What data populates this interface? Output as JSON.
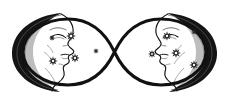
{
  "artwork": {
    "title": "Infinity symbol with crescent moon faces and stars",
    "subject": "double moon infinity tattoo design",
    "style": "black-and-white line art",
    "background_color": "#ffffff",
    "ink_color": "#111111",
    "shading_color": "#5a5a5a",
    "canvas": {
      "width": 229,
      "height": 106
    }
  },
  "composition": {
    "symbol": {
      "name": "infinity-symbol",
      "stroke_color": "#111111",
      "stroke_width": 3.2,
      "crossing_point": {
        "x": 114.5,
        "y": 52
      },
      "left_loop_center": {
        "x": 68,
        "y": 52
      },
      "right_loop_center": {
        "x": 161,
        "y": 52
      },
      "loop_half_width": 47,
      "loop_half_height": 30
    },
    "moons": [
      {
        "name": "moon-face-left",
        "facing": "right",
        "center": {
          "x": 48,
          "y": 52
        },
        "outer_radius": 40,
        "rim_color": "#111111",
        "features": [
          "closed-eye",
          "eyebrow",
          "nose",
          "lips",
          "chin",
          "cheek-hatching"
        ]
      },
      {
        "name": "moon-face-right",
        "facing": "left",
        "center": {
          "x": 181,
          "y": 52
        },
        "outer_radius": 40,
        "rim_color": "#111111",
        "features": [
          "closed-eye",
          "eyebrow",
          "nose",
          "lips",
          "chin",
          "cheek-hatching"
        ]
      }
    ],
    "stars": {
      "count": 10,
      "shape": "six-pointed-sparkle",
      "color": "#2b2b2b",
      "left_loop": [
        {
          "x": 52,
          "y": 38,
          "size": 2.0
        },
        {
          "x": 71,
          "y": 36,
          "size": 3.4
        },
        {
          "x": 96,
          "y": 51,
          "size": 2.0
        },
        {
          "x": 53,
          "y": 61,
          "size": 3.2
        },
        {
          "x": 75,
          "y": 58,
          "size": 3.2
        }
      ],
      "right_loop": [
        {
          "x": 167,
          "y": 36,
          "size": 3.2
        },
        {
          "x": 194,
          "y": 32,
          "size": 2.0
        },
        {
          "x": 152,
          "y": 54,
          "size": 2.8
        },
        {
          "x": 176,
          "y": 53,
          "size": 3.4
        },
        {
          "x": 194,
          "y": 65,
          "size": 3.2
        }
      ]
    }
  }
}
